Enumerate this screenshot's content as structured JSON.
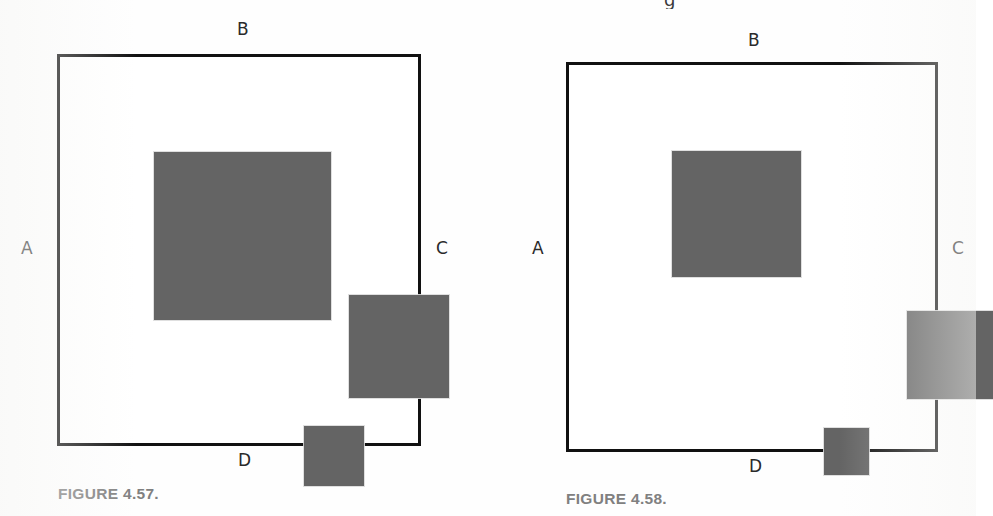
{
  "page": {
    "background_color": "#ffffff",
    "swatch_color": "#646464",
    "frame_color": "#111111",
    "caption_color": "#808080",
    "label_color": "#2a2a2a"
  },
  "figures": [
    {
      "id": "figure-4-57",
      "caption": "FIGURE 4.57.",
      "edge_labels": {
        "left": "A",
        "top": "B",
        "right": "C",
        "bottom": "D"
      },
      "swatches": [
        {
          "name": "large-swatch",
          "size_rank": "large",
          "position": "upper-left",
          "color": "#646464"
        },
        {
          "name": "medium-swatch",
          "size_rank": "medium",
          "position": "center-right",
          "color": "#646464"
        },
        {
          "name": "small-swatch",
          "size_rank": "small",
          "position": "lower-center",
          "color": "#646464"
        }
      ]
    },
    {
      "id": "figure-4-58",
      "caption": "FIGURE 4.58.",
      "edge_labels": {
        "left": "A",
        "top": "B",
        "right": "C",
        "bottom": "D"
      },
      "cut_off_glyph": "g",
      "swatches": [
        {
          "name": "large-swatch",
          "size_rank": "large",
          "position": "upper-left",
          "color": "#646464"
        },
        {
          "name": "medium-swatch",
          "size_rank": "medium",
          "position": "center-right",
          "color": "#646464"
        },
        {
          "name": "small-swatch",
          "size_rank": "small",
          "position": "lower-center",
          "color": "#646464"
        }
      ]
    }
  ]
}
